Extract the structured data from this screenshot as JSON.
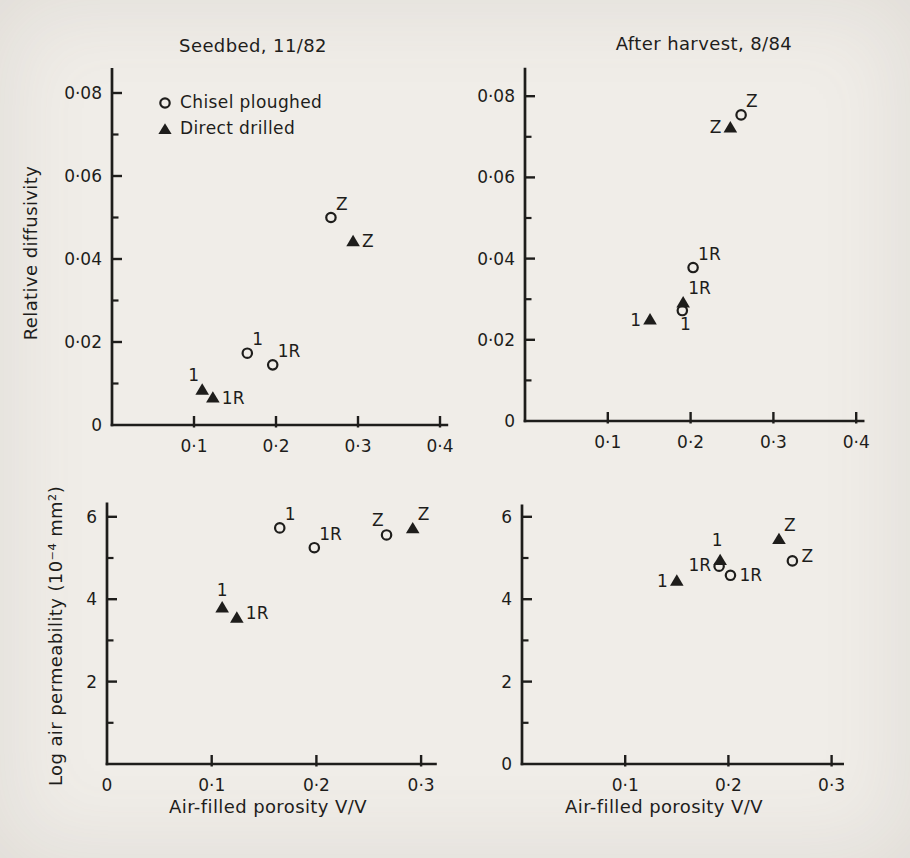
{
  "figure": {
    "background": "#f0ede8",
    "ink": "#1e1d1b"
  },
  "legend": {
    "items": [
      {
        "marker": "circle-open",
        "label": "Chisel ploughed"
      },
      {
        "marker": "triangle-filled",
        "label": "Direct drilled"
      }
    ]
  },
  "chart_data": [
    {
      "id": "seedbed-relative-diffusivity",
      "type": "scatter",
      "title": "Seedbed, 11/82",
      "xlabel": "",
      "ylabel": "Relative diffusivity",
      "xlim": [
        0,
        0.41
      ],
      "ylim": [
        0,
        0.086
      ],
      "grid": false,
      "xticks": [
        {
          "v": 0.1,
          "label": "0·1"
        },
        {
          "v": 0.2,
          "label": "0·2"
        },
        {
          "v": 0.3,
          "label": "0·3"
        },
        {
          "v": 0.4,
          "label": "0·4"
        }
      ],
      "yticks": [
        {
          "v": 0,
          "label": "0"
        },
        {
          "v": 0.02,
          "label": "0·02"
        },
        {
          "v": 0.04,
          "label": "0·04"
        },
        {
          "v": 0.06,
          "label": "0·06"
        },
        {
          "v": 0.08,
          "label": "0·08"
        }
      ],
      "yminor": [
        0.01,
        0.03,
        0.05,
        0.07
      ],
      "series": [
        {
          "name": "Chisel ploughed",
          "marker": "circle-open",
          "points": [
            {
              "x": 0.165,
              "y": 0.0173,
              "label": "1",
              "label_pos": "above-right"
            },
            {
              "x": 0.196,
              "y": 0.0145,
              "label": "1R",
              "label_pos": "above-right"
            },
            {
              "x": 0.267,
              "y": 0.05,
              "label": "Z",
              "label_pos": "above-right"
            }
          ]
        },
        {
          "name": "Direct drilled",
          "marker": "triangle-filled",
          "points": [
            {
              "x": 0.11,
              "y": 0.0085,
              "label": "1",
              "label_pos": "above-left"
            },
            {
              "x": 0.123,
              "y": 0.0066,
              "label": "1R",
              "label_pos": "right"
            },
            {
              "x": 0.294,
              "y": 0.0443,
              "label": "Z",
              "label_pos": "right"
            }
          ]
        }
      ]
    },
    {
      "id": "after-harvest-relative-diffusivity",
      "type": "scatter",
      "title": "After harvest, 8/84",
      "xlabel": "",
      "ylabel": "",
      "xlim": [
        0,
        0.41
      ],
      "ylim": [
        0,
        0.087
      ],
      "grid": false,
      "xticks": [
        {
          "v": 0.1,
          "label": "0·1"
        },
        {
          "v": 0.2,
          "label": "0·2"
        },
        {
          "v": 0.3,
          "label": "0·3"
        },
        {
          "v": 0.4,
          "label": "0·4"
        }
      ],
      "yticks": [
        {
          "v": 0,
          "label": "0"
        },
        {
          "v": 0.02,
          "label": "0·02"
        },
        {
          "v": 0.04,
          "label": "0·04"
        },
        {
          "v": 0.06,
          "label": "0·06"
        },
        {
          "v": 0.08,
          "label": "0·08"
        }
      ],
      "yminor": [
        0.01,
        0.03,
        0.05,
        0.07
      ],
      "series": [
        {
          "name": "Chisel ploughed",
          "marker": "circle-open",
          "points": [
            {
              "x": 0.19,
              "y": 0.0272,
              "label": "1",
              "label_pos": "below"
            },
            {
              "x": 0.203,
              "y": 0.0378,
              "label": "1R",
              "label_pos": "above-right"
            },
            {
              "x": 0.261,
              "y": 0.0754,
              "label": "Z",
              "label_pos": "above-right"
            }
          ]
        },
        {
          "name": "Direct drilled",
          "marker": "triangle-filled",
          "points": [
            {
              "x": 0.151,
              "y": 0.025,
              "label": "1",
              "label_pos": "left"
            },
            {
              "x": 0.191,
              "y": 0.0292,
              "label": "1R",
              "label_pos": "above-right"
            },
            {
              "x": 0.248,
              "y": 0.0723,
              "label": "Z",
              "label_pos": "left"
            }
          ]
        }
      ]
    },
    {
      "id": "seedbed-log-air-permeability",
      "type": "scatter",
      "title": "",
      "xlabel": "Air-filled porosity V/V",
      "ylabel": "Log air permeability (10⁻⁴ mm²)",
      "xlim": [
        0,
        0.315
      ],
      "ylim": [
        0,
        6.35
      ],
      "grid": false,
      "xticks": [
        {
          "v": 0,
          "label": "0"
        },
        {
          "v": 0.1,
          "label": "0·1"
        },
        {
          "v": 0.2,
          "label": "0·2"
        },
        {
          "v": 0.3,
          "label": "0·3"
        }
      ],
      "yticks": [
        {
          "v": 2,
          "label": "2"
        },
        {
          "v": 4,
          "label": "4"
        },
        {
          "v": 6,
          "label": "6"
        }
      ],
      "yminor": [
        1,
        3,
        5
      ],
      "series": [
        {
          "name": "Chisel ploughed",
          "marker": "circle-open",
          "points": [
            {
              "x": 0.165,
              "y": 5.73,
              "label": "1",
              "label_pos": "above-right"
            },
            {
              "x": 0.198,
              "y": 5.25,
              "label": "1R",
              "label_pos": "above-right"
            },
            {
              "x": 0.267,
              "y": 5.56,
              "label": "Z",
              "label_pos": "above-left"
            }
          ]
        },
        {
          "name": "Direct drilled",
          "marker": "triangle-filled",
          "points": [
            {
              "x": 0.11,
              "y": 3.8,
              "label": "1",
              "label_pos": "above"
            },
            {
              "x": 0.124,
              "y": 3.55,
              "label": "1R",
              "label_pos": "right-up"
            },
            {
              "x": 0.292,
              "y": 5.72,
              "label": "Z",
              "label_pos": "above-right"
            }
          ]
        }
      ]
    },
    {
      "id": "after-harvest-log-air-permeability",
      "type": "scatter",
      "title": "",
      "xlabel": "Air-filled porosity V/V",
      "ylabel": "",
      "xlim": [
        0,
        0.312
      ],
      "ylim": [
        0,
        6.3
      ],
      "grid": false,
      "xticks": [
        {
          "v": 0.1,
          "label": "0·1"
        },
        {
          "v": 0.2,
          "label": "0·2"
        },
        {
          "v": 0.3,
          "label": "0·3"
        }
      ],
      "yticks": [
        {
          "v": 0,
          "label": "0"
        },
        {
          "v": 2,
          "label": "2"
        },
        {
          "v": 4,
          "label": "4"
        },
        {
          "v": 6,
          "label": "6"
        }
      ],
      "yminor": [
        1,
        3,
        5
      ],
      "series": [
        {
          "name": "Chisel ploughed",
          "marker": "circle-open",
          "points": [
            {
              "x": 0.191,
              "y": 4.8,
              "label": "1",
              "label_pos": "above-far"
            },
            {
              "x": 0.202,
              "y": 4.58,
              "label": "1R",
              "label_pos": "right"
            },
            {
              "x": 0.262,
              "y": 4.93,
              "label": "Z",
              "label_pos": "right-up"
            }
          ]
        },
        {
          "name": "Direct drilled",
          "marker": "triangle-filled",
          "points": [
            {
              "x": 0.15,
              "y": 4.45,
              "label": "1",
              "label_pos": "left"
            },
            {
              "x": 0.192,
              "y": 4.95,
              "label": "1R",
              "label_pos": "left-low"
            },
            {
              "x": 0.249,
              "y": 5.46,
              "label": "Z",
              "label_pos": "above-right"
            }
          ]
        }
      ]
    }
  ]
}
